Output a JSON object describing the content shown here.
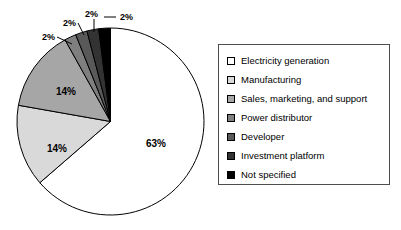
{
  "chart_data": {
    "type": "pie",
    "title": "",
    "categories": [
      "Electricity generation",
      "Manufacturing",
      "Sales, marketing, and support",
      "Power distributor",
      "Developer",
      "Investment platform",
      "Not specified"
    ],
    "values": [
      63,
      14,
      14,
      2,
      2,
      2,
      2
    ],
    "value_labels": [
      "63%",
      "14%",
      "14%",
      "2%",
      "2%",
      "2%",
      "2%"
    ],
    "colors": [
      "#ffffff",
      "#d9d9d9",
      "#a6a6a6",
      "#7f7f7f",
      "#595959",
      "#333333",
      "#000000"
    ],
    "legend_position": "right",
    "grid": false,
    "start_angle_deg": 0,
    "direction": "clockwise"
  },
  "pie": {
    "inside_labels": [
      {
        "text": "63%",
        "x": 146,
        "y": 147
      },
      {
        "text": "14%",
        "x": 47,
        "y": 152
      },
      {
        "text": "14%",
        "x": 56,
        "y": 95
      }
    ],
    "callouts": [
      {
        "text": "2%",
        "tx": 42,
        "ty": 40,
        "lx1": 57,
        "ly1": 37,
        "lx2": 72,
        "ly2": 44
      },
      {
        "text": "2%",
        "tx": 63,
        "ty": 26,
        "lx1": 78,
        "ly1": 23,
        "lx2": 84,
        "ly2": 35
      },
      {
        "text": "2%",
        "tx": 85,
        "ty": 17,
        "lx1": 94,
        "ly1": 19,
        "lx2": 94,
        "ly2": 32
      },
      {
        "text": "2%",
        "tx": 120,
        "ty": 20,
        "lx1": 116,
        "ly1": 17,
        "lx2": 104,
        "ly2": 17
      }
    ]
  },
  "legend": {
    "items": [
      {
        "label": "Electricity generation",
        "color": "#ffffff"
      },
      {
        "label": "Manufacturing",
        "color": "#d9d9d9"
      },
      {
        "label": "Sales, marketing, and support",
        "color": "#a6a6a6"
      },
      {
        "label": "Power distributor",
        "color": "#7f7f7f"
      },
      {
        "label": "Developer",
        "color": "#595959"
      },
      {
        "label": "Investment platform",
        "color": "#333333"
      },
      {
        "label": "Not specified",
        "color": "#000000"
      }
    ]
  }
}
